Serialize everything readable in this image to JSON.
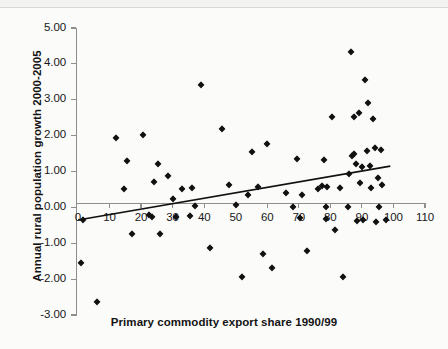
{
  "chart_data": {
    "type": "scatter",
    "title": "",
    "xlabel": "Primary commodity export share 1990/99",
    "ylabel": "Annual rural population growth 2000-2005",
    "xlim": [
      0,
      110
    ],
    "ylim": [
      -3.0,
      5.0
    ],
    "xticks": [
      0,
      10,
      20,
      30,
      40,
      50,
      60,
      70,
      80,
      90,
      100,
      110
    ],
    "xtick_labels": [
      "0",
      "10",
      "20",
      "30",
      "40",
      "50",
      "60",
      "70",
      "80",
      "90",
      "100",
      "110"
    ],
    "yticks": [
      -3.0,
      -2.0,
      -1.0,
      0.0,
      1.0,
      2.0,
      3.0,
      4.0,
      5.0
    ],
    "ytick_labels": [
      "-3.00",
      "-2.00",
      "-1.00",
      "0.00",
      "1.00",
      "2.00",
      "3.00",
      "4.00",
      "5.00"
    ],
    "grid": false,
    "legend": false,
    "marker": "diamond",
    "marker_color": "#111111",
    "axis_color": "#8e8e8e",
    "trendline": {
      "type": "linear",
      "color": "#111111",
      "x_start": 0,
      "y_start": -0.35,
      "x_end": 99,
      "y_end": 1.15,
      "slope": 0.01515,
      "intercept": -0.35
    },
    "points": [
      [
        0.8,
        -1.55
      ],
      [
        1.5,
        -0.35
      ],
      [
        6.0,
        -2.65
      ],
      [
        12.0,
        1.92
      ],
      [
        14.5,
        0.52
      ],
      [
        15.5,
        1.28
      ],
      [
        17.0,
        -0.73
      ],
      [
        20.5,
        2.02
      ],
      [
        22.5,
        -0.22
      ],
      [
        23.5,
        -0.28
      ],
      [
        24.0,
        0.7
      ],
      [
        25.5,
        1.22
      ],
      [
        26.0,
        -0.75
      ],
      [
        28.5,
        0.88
      ],
      [
        30.0,
        0.22
      ],
      [
        31.0,
        -0.28
      ],
      [
        33.0,
        0.5
      ],
      [
        35.5,
        -0.25
      ],
      [
        36.0,
        0.55
      ],
      [
        37.0,
        0.05
      ],
      [
        39.0,
        3.4
      ],
      [
        42.0,
        -1.13
      ],
      [
        45.5,
        2.18
      ],
      [
        48.0,
        0.62
      ],
      [
        50.0,
        0.08
      ],
      [
        52.0,
        -1.95
      ],
      [
        54.0,
        0.35
      ],
      [
        55.0,
        1.55
      ],
      [
        57.0,
        0.57
      ],
      [
        58.5,
        -1.3
      ],
      [
        60.0,
        1.78
      ],
      [
        61.5,
        -1.7
      ],
      [
        66.0,
        0.4
      ],
      [
        68.0,
        0.02
      ],
      [
        69.5,
        1.35
      ],
      [
        70.5,
        -0.3
      ],
      [
        71.0,
        0.35
      ],
      [
        72.5,
        -1.22
      ],
      [
        76.0,
        0.52
      ],
      [
        77.5,
        0.6
      ],
      [
        78.0,
        1.32
      ],
      [
        78.5,
        0.02
      ],
      [
        78.5,
        -0.32
      ],
      [
        79.0,
        0.58
      ],
      [
        80.5,
        2.52
      ],
      [
        81.5,
        -0.62
      ],
      [
        83.0,
        0.55
      ],
      [
        84.0,
        -1.95
      ],
      [
        85.5,
        0.02
      ],
      [
        86.0,
        0.92
      ],
      [
        86.5,
        4.32
      ],
      [
        87.0,
        1.42
      ],
      [
        87.5,
        1.5
      ],
      [
        87.5,
        2.52
      ],
      [
        88.0,
        1.22
      ],
      [
        88.5,
        -0.38
      ],
      [
        89.0,
        2.62
      ],
      [
        89.5,
        0.68
      ],
      [
        90.0,
        1.12
      ],
      [
        90.5,
        -0.35
      ],
      [
        91.0,
        3.55
      ],
      [
        91.5,
        1.58
      ],
      [
        92.0,
        2.92
      ],
      [
        92.5,
        1.15
      ],
      [
        93.0,
        0.55
      ],
      [
        93.5,
        2.45
      ],
      [
        94.0,
        1.65
      ],
      [
        94.5,
        -0.4
      ],
      [
        95.0,
        0.82
      ],
      [
        95.5,
        0.02
      ],
      [
        96.0,
        1.6
      ],
      [
        96.5,
        0.62
      ],
      [
        97.5,
        -0.35
      ]
    ]
  }
}
